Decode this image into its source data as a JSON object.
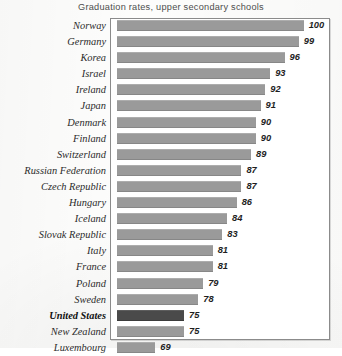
{
  "chart_data": {
    "type": "bar",
    "orientation": "horizontal",
    "title": "Graduation rates, upper secondary schools",
    "xlabel": "",
    "ylabel": "",
    "grid": false,
    "legend": false,
    "axis_visible_range": [
      61,
      103
    ],
    "highlight_category": "United States",
    "colors": {
      "bar": "#9a9a9a",
      "bar_highlight": "#4a4a4a",
      "frame": "#8b8b8b",
      "background": "#ffffff",
      "title_text": "#4d4d4d",
      "label_text": "#2b2b2b",
      "value_text": "#1e1e1e"
    },
    "categories": [
      "Norway",
      "Germany",
      "Korea",
      "Israel",
      "Ireland",
      "Japan",
      "Denmark",
      "Finland",
      "Switzerland",
      "Russian Federation",
      "Czech Republic",
      "Hungary",
      "Iceland",
      "Slovak Republic",
      "Italy",
      "France",
      "Poland",
      "Sweden",
      "United States",
      "New Zealand",
      "Luxembourg"
    ],
    "values": [
      100,
      99,
      96,
      93,
      92,
      91,
      90,
      90,
      89,
      87,
      87,
      86,
      84,
      83,
      81,
      81,
      79,
      78,
      75,
      75,
      69
    ],
    "rows": [
      {
        "label": "Norway",
        "value": 100,
        "value_text": "100",
        "highlight": false
      },
      {
        "label": "Germany",
        "value": 99,
        "value_text": "99",
        "highlight": false
      },
      {
        "label": "Korea",
        "value": 96,
        "value_text": "96",
        "highlight": false
      },
      {
        "label": "Israel",
        "value": 93,
        "value_text": "93",
        "highlight": false
      },
      {
        "label": "Ireland",
        "value": 92,
        "value_text": "92",
        "highlight": false
      },
      {
        "label": "Japan",
        "value": 91,
        "value_text": "91",
        "highlight": false
      },
      {
        "label": "Denmark",
        "value": 90,
        "value_text": "90",
        "highlight": false
      },
      {
        "label": "Finland",
        "value": 90,
        "value_text": "90",
        "highlight": false
      },
      {
        "label": "Switzerland",
        "value": 89,
        "value_text": "89",
        "highlight": false
      },
      {
        "label": "Russian Federation",
        "value": 87,
        "value_text": "87",
        "highlight": false
      },
      {
        "label": "Czech Republic",
        "value": 87,
        "value_text": "87",
        "highlight": false
      },
      {
        "label": "Hungary",
        "value": 86,
        "value_text": "86",
        "highlight": false
      },
      {
        "label": "Iceland",
        "value": 84,
        "value_text": "84",
        "highlight": false
      },
      {
        "label": "Slovak Republic",
        "value": 83,
        "value_text": "83",
        "highlight": false
      },
      {
        "label": "Italy",
        "value": 81,
        "value_text": "81",
        "highlight": false
      },
      {
        "label": "France",
        "value": 81,
        "value_text": "81",
        "highlight": false
      },
      {
        "label": "Poland",
        "value": 79,
        "value_text": "79",
        "highlight": false
      },
      {
        "label": "Sweden",
        "value": 78,
        "value_text": "78",
        "highlight": false
      },
      {
        "label": "United States",
        "value": 75,
        "value_text": "75",
        "highlight": true
      },
      {
        "label": "New Zealand",
        "value": 75,
        "value_text": "75",
        "highlight": false
      },
      {
        "label": "Luxembourg",
        "value": 69,
        "value_text": "69",
        "highlight": false
      }
    ]
  }
}
